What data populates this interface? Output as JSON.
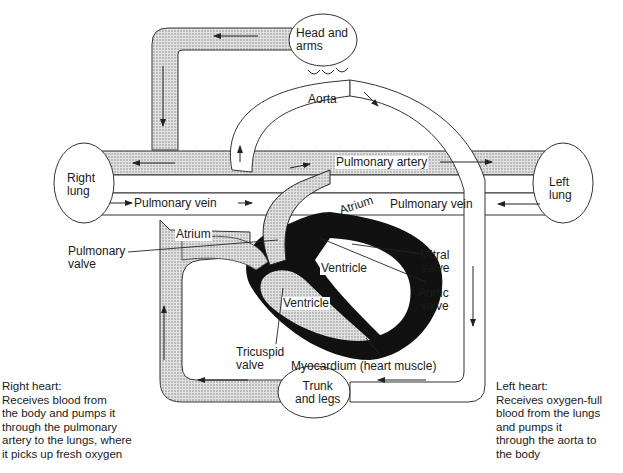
{
  "diagram": {
    "type": "circulatory-system",
    "colors": {
      "deoxygenated_fill": "#cfcfcf",
      "oxygenated_fill": "#ffffff",
      "myocardium": "#111111",
      "outline": "#222222"
    },
    "organs": {
      "head_arms": "Head and\narms",
      "right_lung": "Right\nlung",
      "left_lung": "Left\nlung",
      "trunk_legs": "Trunk\nand legs"
    },
    "vessels": {
      "aorta": "Aorta",
      "pulmonary_artery": "Pulmonary artery",
      "pulmonary_vein_left": "Pulmonary vein",
      "pulmonary_vein_right": "Pulmonary vein"
    },
    "heart": {
      "right_atrium": "Atrium",
      "left_atrium": "Atrium",
      "right_ventricle": "Ventricle",
      "left_ventricle": "Ventricle",
      "pulmonary_valve": "Pulmonary\nvalve",
      "tricuspid_valve": "Tricuspid\nvalve",
      "mitral_valve": "Mitral\nvalve",
      "aortic_valve": "Aortic\nvalve",
      "myocardium": "Myocardium (heart muscle)"
    },
    "captions": {
      "right_heart": "Right heart:\nReceives blood from\nthe body and pumps it\nthrough the pulmonary\nartery to the lungs, where\nit picks up fresh oxygen",
      "left_heart": "Left heart:\nReceives oxygen-full\nblood from the lungs\nand pumps it\nthrough the aorta to\nthe body"
    }
  }
}
